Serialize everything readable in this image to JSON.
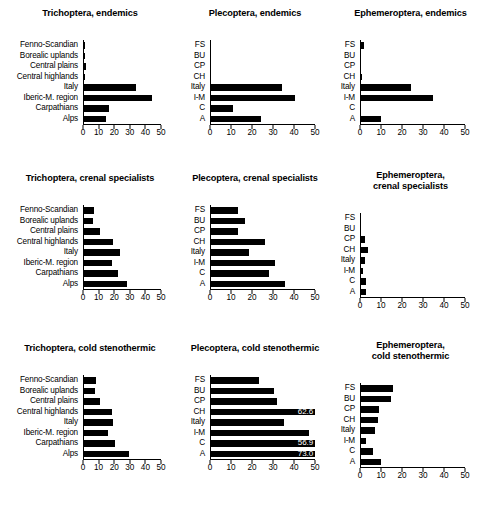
{
  "figure": {
    "axis": {
      "xlim": [
        0,
        50
      ],
      "xticks": [
        0,
        10,
        20,
        30,
        40,
        50
      ],
      "xtick_labels": [
        "0",
        "10",
        "20",
        "30",
        "40",
        "50"
      ]
    },
    "category_labels_full": [
      "Fenno-Scandian",
      "Borealic uplands",
      "Central plains",
      "Central highlands",
      "Italy",
      "Iberic-M. region",
      "Carpathians",
      "Alps"
    ],
    "category_labels_short": [
      "FS",
      "BU",
      "CP",
      "CH",
      "Italy",
      "I-M",
      "C",
      "A"
    ],
    "bar_color": "#000000",
    "value_label_color": "#ffffff"
  },
  "chart_data": [
    {
      "type": "bar",
      "title": "Trichoptera, endemics",
      "orientation": "horizontal",
      "categories": [
        "Fenno-Scandian",
        "Borealic uplands",
        "Central plains",
        "Central highlands",
        "Italy",
        "Iberic-M. region",
        "Carpathians",
        "Alps"
      ],
      "values": [
        0.5,
        0.3,
        1.5,
        0.4,
        34.0,
        44.0,
        16.0,
        14.0
      ],
      "xlabel": "",
      "ylabel": "",
      "xlim": [
        0,
        50
      ],
      "xticks": [
        0,
        10,
        20,
        30,
        40,
        50
      ],
      "grid": false
    },
    {
      "type": "bar",
      "title": "Plecoptera, endemics",
      "orientation": "horizontal",
      "categories": [
        "FS",
        "BU",
        "CP",
        "CH",
        "Italy",
        "I-M",
        "C",
        "A"
      ],
      "values": [
        0.0,
        0.0,
        0.0,
        0.0,
        34.0,
        40.5,
        10.5,
        24.0
      ],
      "xlabel": "",
      "ylabel": "",
      "xlim": [
        0,
        50
      ],
      "xticks": [
        0,
        10,
        20,
        30,
        40,
        50
      ],
      "grid": false
    },
    {
      "type": "bar",
      "title": "Ephemeroptera, endemics",
      "orientation": "horizontal",
      "categories": [
        "FS",
        "BU",
        "CP",
        "CH",
        "Italy",
        "I-M",
        "C",
        "A"
      ],
      "values": [
        1.5,
        0.0,
        0.0,
        0.7,
        24.0,
        34.5,
        0.0,
        9.5
      ],
      "xlabel": "",
      "ylabel": "",
      "xlim": [
        0,
        50
      ],
      "xticks": [
        0,
        10,
        20,
        30,
        40,
        50
      ],
      "grid": false
    },
    {
      "type": "bar",
      "title": "Trichoptera, crenal specialists",
      "orientation": "horizontal",
      "categories": [
        "Fenno-Scandian",
        "Borealic uplands",
        "Central plains",
        "Central highlands",
        "Italy",
        "Iberic-M. region",
        "Carpathians",
        "Alps"
      ],
      "values": [
        6.5,
        5.8,
        10.5,
        19.0,
        23.5,
        18.5,
        22.0,
        28.0
      ],
      "xlabel": "",
      "ylabel": "",
      "xlim": [
        0,
        50
      ],
      "xticks": [
        0,
        10,
        20,
        30,
        40,
        50
      ],
      "grid": false
    },
    {
      "type": "bar",
      "title": "Plecoptera, crenal specialists",
      "orientation": "horizontal",
      "categories": [
        "FS",
        "BU",
        "CP",
        "CH",
        "Italy",
        "I-M",
        "C",
        "A"
      ],
      "values": [
        13.0,
        16.5,
        13.0,
        26.0,
        18.5,
        31.0,
        28.0,
        35.5
      ],
      "xlabel": "",
      "ylabel": "",
      "xlim": [
        0,
        50
      ],
      "xticks": [
        0,
        10,
        20,
        30,
        40,
        50
      ],
      "grid": false
    },
    {
      "type": "bar",
      "title": "Ephemeroptera,\ncrenal specialists",
      "orientation": "horizontal",
      "categories": [
        "FS",
        "BU",
        "CP",
        "CH",
        "Italy",
        "I-M",
        "C",
        "A"
      ],
      "values": [
        0.0,
        0.0,
        2.1,
        3.3,
        1.7,
        1.2,
        2.6,
        2.3
      ],
      "xlabel": "",
      "ylabel": "",
      "xlim": [
        0,
        50
      ],
      "xticks": [
        0,
        10,
        20,
        30,
        40,
        50
      ],
      "grid": false
    },
    {
      "type": "bar",
      "title": "Trichoptera, cold stenothermic",
      "orientation": "horizontal",
      "categories": [
        "Fenno-Scandian",
        "Borealic uplands",
        "Central plains",
        "Central highlands",
        "Italy",
        "Iberic-M. region",
        "Carpathians",
        "Alps"
      ],
      "values": [
        7.5,
        7.0,
        10.5,
        18.5,
        19.0,
        15.5,
        20.0,
        29.0
      ],
      "xlabel": "",
      "ylabel": "",
      "xlim": [
        0,
        50
      ],
      "xticks": [
        0,
        10,
        20,
        30,
        40,
        50
      ],
      "grid": false
    },
    {
      "type": "bar",
      "title": "Plecoptera, cold stenothermic",
      "orientation": "horizontal",
      "categories": [
        "FS",
        "BU",
        "CP",
        "CH",
        "Italy",
        "I-M",
        "C",
        "A"
      ],
      "values": [
        23.0,
        30.5,
        31.5,
        62.6,
        35.0,
        47.0,
        56.9,
        73.0
      ],
      "value_labels": [
        null,
        null,
        null,
        "62.6",
        null,
        null,
        "56.9",
        "73.0"
      ],
      "xlabel": "",
      "ylabel": "",
      "xlim": [
        0,
        50
      ],
      "xticks": [
        0,
        10,
        20,
        30,
        40,
        50
      ],
      "grid": false,
      "note": "bars exceeding the axis maximum are clipped and annotated with their value"
    },
    {
      "type": "bar",
      "title": "Ephemeroptera,\ncold stenothermic",
      "orientation": "horizontal",
      "categories": [
        "FS",
        "BU",
        "CP",
        "CH",
        "Italy",
        "I-M",
        "C",
        "A"
      ],
      "values": [
        15.5,
        14.5,
        8.7,
        8.2,
        6.7,
        2.5,
        6.0,
        9.8
      ],
      "xlabel": "",
      "ylabel": "",
      "xlim": [
        0,
        50
      ],
      "xticks": [
        0,
        10,
        20,
        30,
        40,
        50
      ],
      "grid": false
    }
  ]
}
